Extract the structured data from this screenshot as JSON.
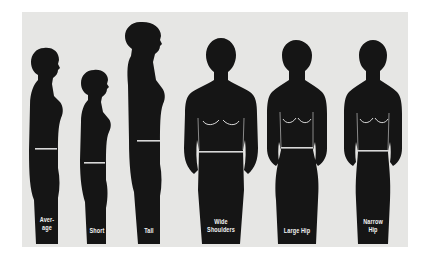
{
  "colors": {
    "page_background": "#ffffff",
    "panel_background": "#e6e6e4",
    "silhouette": "#151515",
    "waist_line": "#d8d8d8",
    "label_text": "#f2f2f2"
  },
  "figures": [
    {
      "id": "average",
      "view": "profile",
      "label": "Aver-\nage"
    },
    {
      "id": "short",
      "view": "profile",
      "label": "Short"
    },
    {
      "id": "tall",
      "view": "profile",
      "label": "Tall"
    },
    {
      "id": "wide-shoulders",
      "view": "front",
      "label": "Wide\nShoulders"
    },
    {
      "id": "large-hip",
      "view": "front",
      "label": "Large Hip"
    },
    {
      "id": "narrow-hip",
      "view": "front",
      "label": "Narrow\nHip"
    }
  ]
}
